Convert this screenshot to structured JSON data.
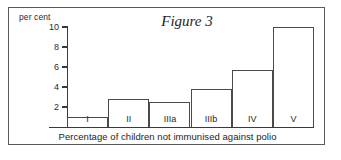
{
  "chart_data": {
    "type": "bar",
    "title": "Figure 3",
    "categories": [
      "I",
      "II",
      "IIIa",
      "IIIb",
      "IV",
      "V"
    ],
    "values": [
      1.0,
      2.85,
      2.5,
      3.8,
      5.75,
      10.0
    ],
    "xlabel": "Percentage of children not immunised against polio",
    "ylabel": "per cent",
    "ylim": [
      0,
      10
    ],
    "yticks": [
      2,
      4,
      6,
      8,
      10
    ],
    "ytick_labels": [
      "2",
      "4",
      "6",
      "8",
      "10"
    ],
    "grid": false,
    "legend": "none",
    "bar_style": "outline-only"
  },
  "figure": {
    "title": "Figure 3",
    "y_axis_label": "per cent",
    "caption": "Percentage of children not immunised against polio",
    "ticks": [
      {
        "label": "10",
        "value": 10
      },
      {
        "label": "8",
        "value": 8
      },
      {
        "label": "6",
        "value": 6
      },
      {
        "label": "4",
        "value": 4
      },
      {
        "label": "2",
        "value": 2
      }
    ],
    "bars": [
      {
        "label": "I",
        "value": 1.0
      },
      {
        "label": "II",
        "value": 2.85
      },
      {
        "label": "IIIa",
        "value": 2.5
      },
      {
        "label": "IIIb",
        "value": 3.8
      },
      {
        "label": "IV",
        "value": 5.75
      },
      {
        "label": "V",
        "value": 10.0
      }
    ]
  },
  "colors": {
    "frame": "#5a5a5a",
    "axis": "#3a3a3a",
    "bar_outline": "#4a4a4a",
    "text": "#1e1e1e",
    "background": "#ffffff"
  }
}
